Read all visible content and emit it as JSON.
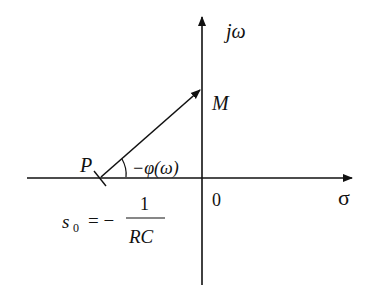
{
  "diagram": {
    "type": "s-plane pole vector diagram",
    "axes": {
      "vertical_label": "jω",
      "horizontal_label": "σ",
      "origin_label": "0"
    },
    "points": {
      "pole_label": "P",
      "point_on_axis_label": "M"
    },
    "angle_label": "−φ(ω)",
    "pole_equation": {
      "lhs": "s",
      "subscript": "0",
      "equals": "= −",
      "numerator": "1",
      "denominator": "RC"
    },
    "colors": {
      "stroke": "#111111",
      "background": "#ffffff"
    }
  }
}
